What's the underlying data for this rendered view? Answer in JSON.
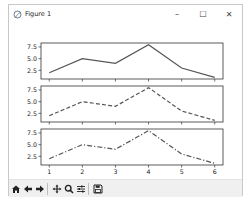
{
  "window": {
    "title": "Figure 1",
    "controls": {
      "minimize": "–",
      "maximize": "☐",
      "close": "✕"
    }
  },
  "toolbar": {
    "buttons": [
      {
        "name": "home",
        "icon": "home-icon"
      },
      {
        "name": "back",
        "icon": "arrow-left-icon"
      },
      {
        "name": "forward",
        "icon": "arrow-right-icon"
      },
      {
        "name": "pan",
        "icon": "move-icon"
      },
      {
        "name": "zoom",
        "icon": "magnifier-icon"
      },
      {
        "name": "subplots",
        "icon": "sliders-icon"
      },
      {
        "name": "save",
        "icon": "floppy-icon"
      }
    ]
  },
  "chart_data": [
    {
      "type": "line",
      "x": [
        1,
        2,
        3,
        4,
        5,
        6
      ],
      "series": [
        {
          "name": "solid",
          "values": [
            2,
            5,
            4,
            8,
            3,
            1
          ],
          "linestyle": "solid"
        }
      ],
      "yticks": [
        "2.5",
        "5.0",
        "7.5"
      ],
      "ylim": [
        0.65,
        8.35
      ],
      "xtick_labels_visible": false
    },
    {
      "type": "line",
      "x": [
        1,
        2,
        3,
        4,
        5,
        6
      ],
      "series": [
        {
          "name": "dashed",
          "values": [
            2,
            5,
            4,
            8,
            3,
            1
          ],
          "linestyle": "dashed"
        }
      ],
      "yticks": [
        "2.5",
        "5.0",
        "7.5"
      ],
      "ylim": [
        0.65,
        8.35
      ],
      "xtick_labels_visible": false
    },
    {
      "type": "line",
      "x": [
        1,
        2,
        3,
        4,
        5,
        6
      ],
      "series": [
        {
          "name": "dashdot",
          "values": [
            2,
            5,
            4,
            8,
            3,
            1
          ],
          "linestyle": "dashdot"
        }
      ],
      "yticks": [
        "2.5",
        "5.0",
        "7.5"
      ],
      "xticks": [
        "1",
        "2",
        "3",
        "4",
        "5",
        "6"
      ],
      "ylim": [
        0.65,
        8.35
      ],
      "xtick_labels_visible": true
    }
  ],
  "colors": {
    "line": "#555555",
    "axes": "#333333"
  }
}
